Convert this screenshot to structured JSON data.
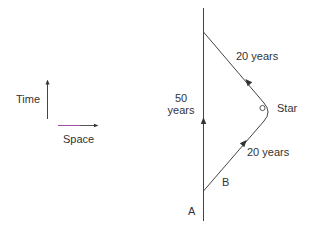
{
  "diagram": {
    "type": "spacetime-diagram",
    "axes_legend": {
      "time_label": "Time",
      "space_label": "Space"
    },
    "labels": {
      "stay_duration_line1": "50",
      "stay_duration_line2": "years",
      "outbound_duration": "20 years",
      "return_duration": "20 years",
      "star": "Star",
      "observer_a": "A",
      "observer_b": "B"
    },
    "colors": {
      "line": "#444444",
      "space_arrow_accent": "#a050a0"
    }
  }
}
